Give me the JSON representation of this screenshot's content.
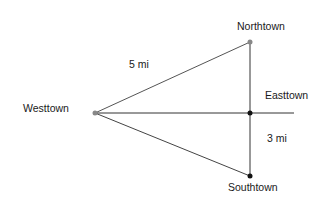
{
  "diagram": {
    "points": {
      "westtown": {
        "label": "Westtown",
        "x": 95,
        "y": 113,
        "color": "#888888"
      },
      "northtown": {
        "label": "Northtown",
        "x": 250,
        "y": 42,
        "color": "#888888"
      },
      "easttown": {
        "label": "Easttown",
        "x": 250,
        "y": 113,
        "color": "#111111"
      },
      "southtown": {
        "label": "Southtown",
        "x": 250,
        "y": 176,
        "color": "#111111"
      }
    },
    "distances": {
      "west_north": "5 mi",
      "east_south": "3 mi"
    },
    "line_end_x": 294
  }
}
